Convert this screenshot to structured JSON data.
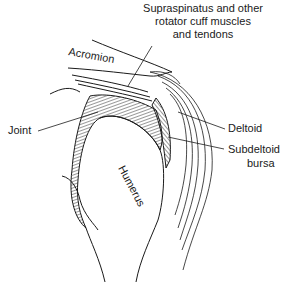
{
  "figure": {
    "labels": {
      "supraspinatus_line1": "Supraspinatus and other",
      "supraspinatus_line2": "rotator cuff muscles",
      "supraspinatus_line3": "and tendons",
      "acromion": "Acromion",
      "joint": "Joint",
      "deltoid": "Deltoid",
      "subdeltoid_line1": "Subdeltoid",
      "subdeltoid_line2": "bursa",
      "humerus": "Humerus"
    },
    "colors": {
      "ink": "#1a1a1a",
      "background": "#ffffff"
    }
  }
}
